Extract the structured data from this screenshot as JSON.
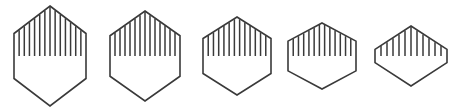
{
  "figure": {
    "background_color": "#ffffff",
    "stroke_color": "#3a3a3a",
    "hatch_color": "#3a3a3a",
    "outline_width": 1.6,
    "hatch_width": 1.5,
    "canvas": {
      "width": 463,
      "height": 111
    },
    "shape_count": 5,
    "center_y": 56,
    "shapes": [
      {
        "name": "hexagon-1",
        "index": 1,
        "center_x": 50,
        "center_y": 56,
        "half_width": 36,
        "half_height": 50,
        "flat_ratio": 0.45,
        "hatch_count": 13,
        "fill_fraction": 0.5
      },
      {
        "name": "hexagon-2",
        "index": 2,
        "center_x": 145,
        "center_y": 56,
        "half_width": 35,
        "half_height": 45,
        "flat_ratio": 0.45,
        "hatch_count": 13,
        "fill_fraction": 0.5
      },
      {
        "name": "hexagon-3",
        "index": 3,
        "center_x": 237,
        "center_y": 56,
        "half_width": 34,
        "half_height": 39,
        "flat_ratio": 0.45,
        "hatch_count": 12,
        "fill_fraction": 0.5
      },
      {
        "name": "hexagon-4",
        "index": 4,
        "center_x": 322,
        "center_y": 56,
        "half_width": 34,
        "half_height": 33,
        "flat_ratio": 0.45,
        "hatch_count": 12,
        "fill_fraction": 0.5
      },
      {
        "name": "hexagon-5",
        "index": 5,
        "center_x": 411,
        "center_y": 56,
        "half_width": 36,
        "half_height": 30,
        "flat_ratio": 0.22,
        "hatch_count": 11,
        "fill_fraction": 0.5
      }
    ]
  }
}
